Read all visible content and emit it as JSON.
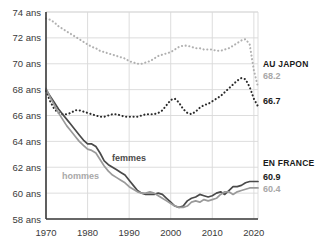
{
  "chart_data": {
    "type": "line",
    "title": "",
    "xlabel": "",
    "ylabel": "",
    "xlim": [
      1970,
      2021
    ],
    "ylim": [
      58,
      74
    ],
    "grid": true,
    "legend_position": "inline-annotations",
    "ytick_labels": [
      "74 ans",
      "72 ans",
      "70 ans",
      "68 ans",
      "66 ans",
      "64 ans",
      "62 ans",
      "60 ans",
      "58 ans"
    ],
    "ytick_values": [
      74,
      72,
      70,
      68,
      66,
      64,
      62,
      60,
      58
    ],
    "xtick_labels": [
      "1970",
      "1980",
      "1990",
      "2000",
      "2010",
      "2020"
    ],
    "xtick_values": [
      1970,
      1980,
      1990,
      2000,
      2010,
      2020
    ],
    "series": [
      {
        "name": "Japon hommes",
        "style": "dotted",
        "color": "#b0b0b0",
        "end_label": "68.2",
        "x": [
          1970,
          1971,
          1972,
          1973,
          1974,
          1975,
          1976,
          1977,
          1978,
          1979,
          1980,
          1981,
          1982,
          1983,
          1984,
          1985,
          1986,
          1987,
          1988,
          1989,
          1990,
          1991,
          1992,
          1993,
          1994,
          1995,
          1996,
          1997,
          1998,
          1999,
          2000,
          2001,
          2002,
          2003,
          2004,
          2005,
          2006,
          2007,
          2008,
          2009,
          2010,
          2011,
          2012,
          2013,
          2014,
          2015,
          2016,
          2017,
          2018,
          2019,
          2020,
          2021
        ],
        "values": [
          73.5,
          73.4,
          73.2,
          72.9,
          72.7,
          72.5,
          72.3,
          72.1,
          71.9,
          71.7,
          71.5,
          71.3,
          71.2,
          71.0,
          70.9,
          70.8,
          70.7,
          70.6,
          70.5,
          70.4,
          70.2,
          70.1,
          70.0,
          70.0,
          70.1,
          70.2,
          70.4,
          70.6,
          70.7,
          70.8,
          70.9,
          71.1,
          71.3,
          71.4,
          71.4,
          71.3,
          71.2,
          71.2,
          71.1,
          71.1,
          71.1,
          71.0,
          71.0,
          71.1,
          71.2,
          71.4,
          71.6,
          71.8,
          71.9,
          71.5,
          69.5,
          68.2
        ]
      },
      {
        "name": "Japon femmes",
        "style": "dotted",
        "color": "#2b2b2b",
        "end_label": "66.7",
        "x": [
          1970,
          1971,
          1972,
          1973,
          1974,
          1975,
          1976,
          1977,
          1978,
          1979,
          1980,
          1981,
          1982,
          1983,
          1984,
          1985,
          1986,
          1987,
          1988,
          1989,
          1990,
          1991,
          1992,
          1993,
          1994,
          1995,
          1996,
          1997,
          1998,
          1999,
          2000,
          2001,
          2002,
          2003,
          2004,
          2005,
          2006,
          2007,
          2008,
          2009,
          2010,
          2011,
          2012,
          2013,
          2014,
          2015,
          2016,
          2017,
          2018,
          2019,
          2020,
          2021
        ],
        "values": [
          67.9,
          67.1,
          66.5,
          66.2,
          66.1,
          66.1,
          66.2,
          66.4,
          66.4,
          66.3,
          66.2,
          66.1,
          66.0,
          65.9,
          65.9,
          66.0,
          66.1,
          66.1,
          66.0,
          65.9,
          65.9,
          65.9,
          65.9,
          66.0,
          66.1,
          66.1,
          66.1,
          66.2,
          66.4,
          66.8,
          67.2,
          67.3,
          67.0,
          66.5,
          66.2,
          66.1,
          66.3,
          66.6,
          66.8,
          66.9,
          67.1,
          67.3,
          67.5,
          67.8,
          68.1,
          68.4,
          68.7,
          68.9,
          68.8,
          68.2,
          67.3,
          66.7
        ]
      },
      {
        "name": "France femmes",
        "style": "solid",
        "color": "#4a4a4a",
        "end_label": "60.9",
        "x": [
          1970,
          1971,
          1972,
          1973,
          1974,
          1975,
          1976,
          1977,
          1978,
          1979,
          1980,
          1981,
          1982,
          1983,
          1984,
          1985,
          1986,
          1987,
          1988,
          1989,
          1990,
          1991,
          1992,
          1993,
          1994,
          1995,
          1996,
          1997,
          1998,
          1999,
          2000,
          2001,
          2002,
          2003,
          2004,
          2005,
          2006,
          2007,
          2008,
          2009,
          2010,
          2011,
          2012,
          2013,
          2014,
          2015,
          2016,
          2017,
          2018,
          2019,
          2020,
          2021
        ],
        "values": [
          68.0,
          67.5,
          67.0,
          66.5,
          66.1,
          65.7,
          65.3,
          64.9,
          64.5,
          64.1,
          63.8,
          63.8,
          63.6,
          63.1,
          62.5,
          62.2,
          62.0,
          61.8,
          61.6,
          61.4,
          61.0,
          60.6,
          60.2,
          60.0,
          59.9,
          59.9,
          59.9,
          60.0,
          59.9,
          59.6,
          59.3,
          59.0,
          58.9,
          59.0,
          59.4,
          59.6,
          59.7,
          59.9,
          59.8,
          59.7,
          59.8,
          60.0,
          60.1,
          59.9,
          60.2,
          60.5,
          60.5,
          60.6,
          60.8,
          60.9,
          60.9,
          60.9
        ]
      },
      {
        "name": "France hommes",
        "style": "solid",
        "color": "#9a9a9a",
        "end_label": "60.4",
        "x": [
          1970,
          1971,
          1972,
          1973,
          1974,
          1975,
          1976,
          1977,
          1978,
          1979,
          1980,
          1981,
          1982,
          1983,
          1984,
          1985,
          1986,
          1987,
          1988,
          1989,
          1990,
          1991,
          1992,
          1993,
          1994,
          1995,
          1996,
          1997,
          1998,
          1999,
          2000,
          2001,
          2002,
          2003,
          2004,
          2005,
          2006,
          2007,
          2008,
          2009,
          2010,
          2011,
          2012,
          2013,
          2014,
          2015,
          2016,
          2017,
          2018,
          2019,
          2020,
          2021
        ],
        "values": [
          68.1,
          67.4,
          66.8,
          66.2,
          65.7,
          65.2,
          64.8,
          64.4,
          64.0,
          63.7,
          63.4,
          63.3,
          63.1,
          62.6,
          62.1,
          61.7,
          61.4,
          61.2,
          61.0,
          60.8,
          60.5,
          60.3,
          60.1,
          60.0,
          60.0,
          60.1,
          60.0,
          59.8,
          59.6,
          59.4,
          59.2,
          59.0,
          58.9,
          58.9,
          59.0,
          59.3,
          59.4,
          59.3,
          59.5,
          59.4,
          59.5,
          59.6,
          59.9,
          60.1,
          60.1,
          59.9,
          60.1,
          60.2,
          60.3,
          60.4,
          60.4,
          60.4
        ]
      }
    ],
    "inline_labels": [
      {
        "text": "femmes",
        "color": "#4a4a4a",
        "x": 112,
        "y": 161
      },
      {
        "text": "hommes",
        "color": "#a8a8a8",
        "x": 62,
        "y": 179
      }
    ],
    "annotations": [
      {
        "title": "AU JAPON",
        "value_dark": "66.7",
        "value_gray": "68.2"
      },
      {
        "title": "EN FRANCE",
        "value_dark": "60.9",
        "value_gray": "60.4"
      }
    ]
  },
  "colors": {
    "japan_men": "#b0b0b0",
    "japan_women": "#2b2b2b",
    "france_women": "#4a4a4a",
    "france_men": "#9a9a9a",
    "grid": "#d9d9d9",
    "axis": "#3a3a3a",
    "text": "#1a1a1a",
    "text_muted": "#a8a8a8"
  }
}
